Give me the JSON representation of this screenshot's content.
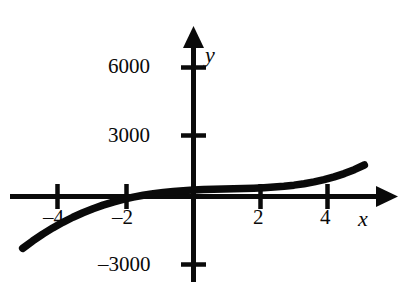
{
  "figure": {
    "background_color": "#ffffff",
    "ink_color": "#0a0a0a"
  },
  "chart_data": {
    "type": "line",
    "title": "",
    "subtitle": "",
    "xlabel": "x",
    "ylabel": "y",
    "grid": false,
    "legend": null,
    "xlim": [
      -5.2,
      5.6
    ],
    "ylim": [
      -3400,
      7400
    ],
    "x_ticks": [
      -4,
      -2,
      2,
      4
    ],
    "x_tick_labels": [
      "–4",
      "–2",
      "2",
      "4"
    ],
    "y_ticks": [
      6000,
      3000,
      -3000
    ],
    "y_tick_labels": [
      "6000",
      "3000",
      "–3000"
    ],
    "axis_arrows": [
      "x-positive",
      "y-positive"
    ],
    "series": [
      {
        "name": "curve",
        "x": [
          -5.1,
          -4.8,
          -4.5,
          -4.2,
          -3.9,
          -3.6,
          -3.3,
          -3.0,
          -2.7,
          -2.4,
          -2.1,
          -1.8,
          -1.5,
          -1.2,
          -0.9,
          -0.6,
          -0.3,
          0.0,
          0.3,
          0.6,
          0.9,
          1.2,
          1.5,
          1.8,
          2.1,
          2.4,
          2.7,
          3.0,
          3.3,
          3.6,
          3.9,
          4.2,
          4.5,
          4.8,
          5.1
        ],
        "y": [
          -2413,
          -2066,
          -1749,
          -1461,
          -1200,
          -965,
          -755,
          -568,
          -403,
          -259,
          -135,
          -29,
          59,
          132,
          191,
          237,
          273,
          300,
          320,
          335,
          347,
          358,
          371,
          387,
          408,
          437,
          476,
          528,
          594,
          678,
          783,
          911,
          1065,
          1249,
          1464
        ]
      }
    ],
    "annotations": []
  },
  "labels": {
    "y_6000": "6000",
    "y_3000": "3000",
    "y_neg3000": "–3000",
    "x_neg4": "–4",
    "x_neg2": "–2",
    "x_2": "2",
    "x_4": "4",
    "axis_x": "x",
    "axis_y": "y"
  }
}
